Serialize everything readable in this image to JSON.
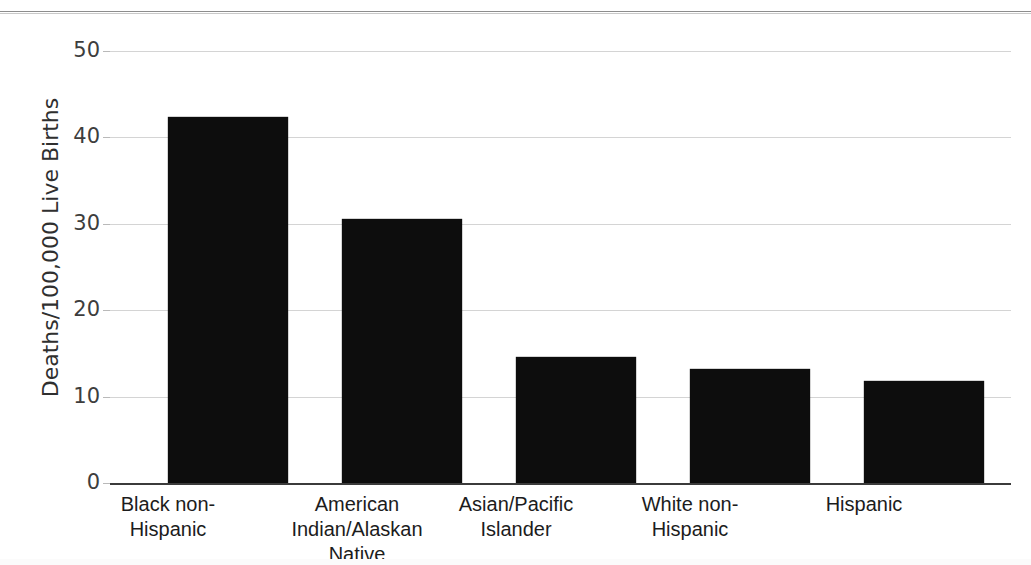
{
  "figure": {
    "top_clip_fragment": "  ",
    "background_color": "#ffffff",
    "bar_color": "#0d0d0d",
    "gridline_color": "#d4d4d4",
    "axis_color": "#3b3b3b"
  },
  "chart_data": {
    "type": "bar",
    "title": "",
    "xlabel": "",
    "ylabel": "Deaths/100,000 Live Births",
    "categories": [
      "Black non-Hispanic",
      "American Indian/Alaskan Native",
      "Asian/Pacific Islander",
      "White non-Hispanic",
      "Hispanic"
    ],
    "category_lines": [
      [
        "Black non-",
        "Hispanic"
      ],
      [
        "American",
        "Indian/Alaskan",
        "Native"
      ],
      [
        "Asian/Pacific",
        "Islander"
      ],
      [
        "White non-",
        "Hispanic"
      ],
      [
        "Hispanic"
      ]
    ],
    "values": [
      42.4,
      30.5,
      14.6,
      13.2,
      11.8
    ],
    "ylim": [
      0,
      50
    ],
    "yticks": [
      0,
      10,
      20,
      30,
      40,
      50
    ],
    "ytick_labels": [
      "0",
      "10",
      "20",
      "30",
      "40",
      "50"
    ],
    "grid": true,
    "grid_axis": "y",
    "legend": false,
    "legend_position": "none"
  }
}
